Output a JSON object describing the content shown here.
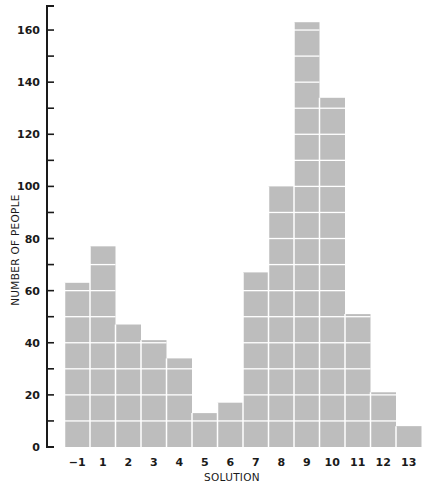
{
  "chart_data": {
    "type": "bar",
    "title": "",
    "xlabel": "SOLUTION",
    "ylabel": "NUMBER OF PEOPLE",
    "categories": [
      "−1",
      "1",
      "2",
      "3",
      "4",
      "5",
      "6",
      "7",
      "8",
      "9",
      "10",
      "11",
      "12",
      "13"
    ],
    "values": [
      63,
      77,
      47,
      41,
      34,
      13,
      17,
      67,
      100,
      163,
      134,
      51,
      21,
      8
    ],
    "ylim": [
      0,
      166
    ],
    "yticks": [
      0,
      20,
      40,
      60,
      80,
      100,
      120,
      140,
      160
    ],
    "minor_tick_step": 10,
    "grid": "white horizontal lines inside bars every 10 units",
    "legend": null
  },
  "style": {
    "bar_color": "#bdbdbd",
    "grid_color": "#ffffff",
    "axis_color": "#1a1a1a"
  }
}
